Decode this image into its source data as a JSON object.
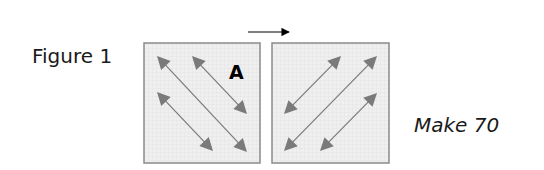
{
  "figure_label": "Figure 1",
  "caption": "Make 70",
  "direction_arrow": {
    "from": [
      248,
      32
    ],
    "to": [
      296,
      32
    ],
    "color": "#000000"
  },
  "colors": {
    "square_fill": "#ececec",
    "square_border": "#8a8a8a",
    "grid_line": "#e0e0e0",
    "arrow_color": "#7a7a7a",
    "text": "#1a1a1a"
  },
  "squares": [
    {
      "id": "A",
      "label": "A",
      "x": 144,
      "y": 43,
      "w": 116,
      "h": 120,
      "arrows": [
        {
          "from": [
            157,
            56
          ],
          "to": [
            247,
            152
          ]
        },
        {
          "from": [
            192,
            56
          ],
          "to": [
            247,
            114
          ]
        },
        {
          "from": [
            157,
            92
          ],
          "to": [
            213,
            151
          ]
        }
      ]
    },
    {
      "id": "B",
      "label": "",
      "x": 272,
      "y": 43,
      "w": 117,
      "h": 120,
      "arrows": [
        {
          "from": [
            284,
            114
          ],
          "to": [
            341,
            56
          ]
        },
        {
          "from": [
            284,
            151
          ],
          "to": [
            377,
            56
          ]
        },
        {
          "from": [
            320,
            151
          ],
          "to": [
            377,
            93
          ]
        }
      ]
    }
  ]
}
